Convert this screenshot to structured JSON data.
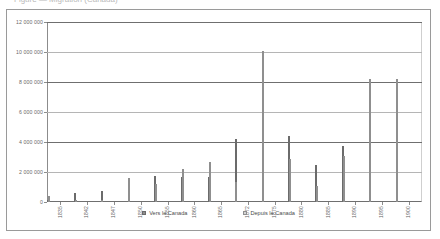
{
  "caption": "Figure — Migration (Canada)",
  "legend": {
    "series0_label": "Vers le Canada",
    "series1_label": "Depuis le Canada"
  },
  "colors": {
    "series0": "#8e8e8e",
    "series1": "#d4d4d4",
    "gridline": "#b5b5b5",
    "axis": "#6f6f6f",
    "frame": "#9a9a9a"
  },
  "chart_data": {
    "type": "bar",
    "title": "",
    "subtitle": "",
    "xlabel": "",
    "ylabel": "",
    "ylim": [
      0,
      12000000
    ],
    "ytick_labels": [
      "0",
      "2 000 000",
      "4 000 000",
      "6 000 000",
      "8 000 000",
      "10 000 000",
      "12 000 000"
    ],
    "ytick_values": [
      0,
      2000000,
      4000000,
      6000000,
      8000000,
      10000000,
      12000000
    ],
    "grid": true,
    "legend_position": "bottom",
    "categories": [
      "1835",
      "1842",
      "1847",
      "1850",
      "1855",
      "1860",
      "1865",
      "1872",
      "1875",
      "1880",
      "1885",
      "1890",
      "1895",
      "1900"
    ],
    "series": [
      {
        "name": "Vers le Canada",
        "values": [
          150000,
          600000,
          750000,
          350000,
          1750000,
          1650000,
          1700000,
          4200000,
          5300000,
          4400000,
          2500000,
          3750000,
          3200000,
          5800000
        ]
      },
      {
        "name": "Depuis le Canada",
        "values": [
          420000,
          60000,
          100000,
          1600000,
          1200000,
          2200000,
          2700000,
          1350000,
          10100000,
          2850000,
          1050000,
          3100000,
          8200000,
          8200000
        ]
      }
    ]
  }
}
